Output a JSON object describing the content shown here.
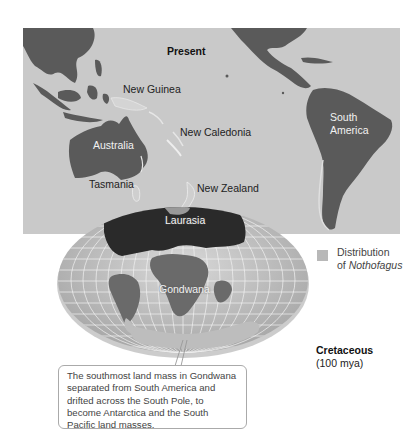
{
  "map": {
    "title": "Present",
    "labels": {
      "new_guinea": "New Guinea",
      "new_caledonia": "New Caledonia",
      "australia": "Australia",
      "tasmania": "Tasmania",
      "new_zealand": "New Zealand",
      "south_america": "South America"
    },
    "colors": {
      "ocean": "#c9c9c9",
      "land": "#5a5a5a",
      "distribution": "#b8b8b8"
    }
  },
  "globe": {
    "labels": {
      "laurasia": "Laurasia",
      "gondwana": "Gondwana"
    }
  },
  "legend": {
    "line1": "Distribution",
    "line2_prefix": "of ",
    "line2_species": "Nothofagus"
  },
  "period": {
    "name": "Cretaceous",
    "age": "(100 mya)"
  },
  "callout": {
    "text": "The southmost land mass in Gondwana separated from South America and drifted across the South Pole, to become Antarctica and the South Pacific land masses."
  }
}
